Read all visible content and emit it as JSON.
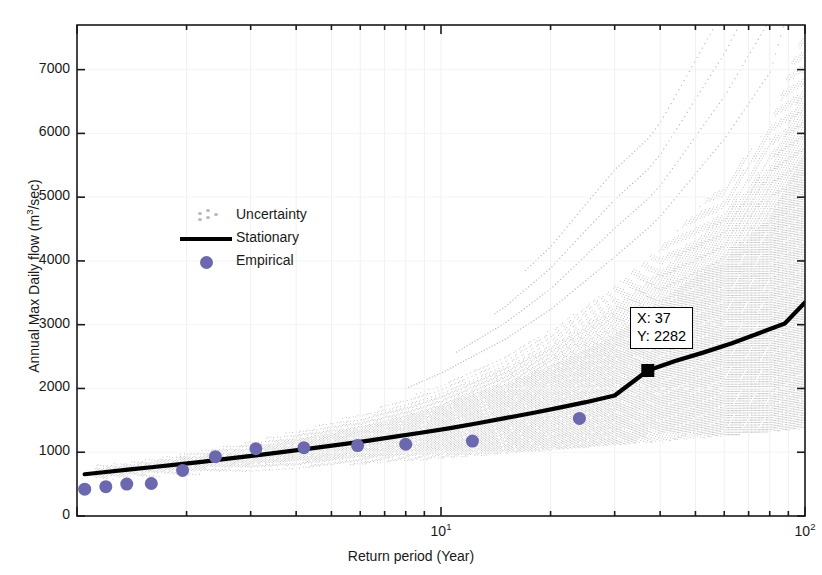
{
  "figure": {
    "title": "Adezai River at Adezai Bridge",
    "background": "#ffffff"
  },
  "datatip": {
    "x_label": "X: 37",
    "y_label": "Y: 2282",
    "marker_color": "#000000"
  },
  "legend": {
    "entries": [
      {
        "label": "Uncertainty",
        "style": "dotted",
        "color": "#b9b9b9"
      },
      {
        "label": "Stationary",
        "style": "line",
        "color": "#000000"
      },
      {
        "label": "Empirical",
        "style": "marker",
        "color": "#6b68b0"
      }
    ]
  },
  "chart_data": {
    "type": "line",
    "title": "Adezai River at Adezai Bridge",
    "xlabel": "Return period (Year)",
    "ylabel": "Annual Max  Daily flow (m3/sec)",
    "ylabel_display": "Annual Max  Daily flow (m&sup3;/sec)",
    "xscale": "log",
    "yscale": "linear",
    "xlim": [
      1,
      100
    ],
    "ylim": [
      0,
      7700
    ],
    "xticks": [
      10,
      100
    ],
    "xtick_labels": [
      "10^1",
      "10^2"
    ],
    "yticks": [
      0,
      1000,
      2000,
      3000,
      4000,
      5000,
      6000,
      7000
    ],
    "ytick_labels": [
      "0",
      "1000",
      "2000",
      "3000",
      "4000",
      "5000",
      "6000",
      "7000"
    ],
    "grid": false,
    "legend_position": "center-left",
    "series": [
      {
        "name": "Stationary",
        "type": "line",
        "color": "#000000",
        "linewidth": 4,
        "x": [
          1.05,
          1.2,
          1.4,
          1.6,
          1.9,
          2.2,
          2.6,
          3.1,
          3.7,
          4.4,
          5.2,
          6.2,
          7.4,
          8.8,
          10.5,
          12.5,
          15,
          18,
          21,
          25,
          30,
          37,
          44,
          53,
          63,
          75,
          88,
          100
        ],
        "y": [
          655,
          690,
          730,
          765,
          810,
          850,
          900,
          950,
          1005,
          1060,
          1115,
          1175,
          1240,
          1305,
          1375,
          1450,
          1535,
          1620,
          1695,
          1785,
          1890,
          2282,
          2430,
          2570,
          2710,
          2870,
          3020,
          3350
        ]
      },
      {
        "name": "Empirical",
        "type": "scatter",
        "color": "#6b68b0",
        "marker": "circle",
        "markersize": 13,
        "x": [
          1.05,
          1.2,
          1.37,
          1.6,
          1.95,
          2.4,
          3.1,
          4.2,
          5.9,
          8.0,
          12.2,
          24.0
        ],
        "y": [
          420,
          460,
          500,
          510,
          715,
          930,
          1055,
          1070,
          1105,
          1125,
          1175,
          1530
        ]
      },
      {
        "name": "Uncertainty",
        "type": "band",
        "color": "#c4c4c4",
        "description": "Dotted Monte-Carlo ensemble envelope fanning out with return period",
        "x": [
          1.05,
          1.5,
          2,
          3,
          4,
          6,
          8,
          10,
          15,
          20,
          30,
          40,
          60,
          80,
          100
        ],
        "upper": [
          780,
          880,
          990,
          1180,
          1340,
          1610,
          1850,
          2060,
          2520,
          2920,
          3620,
          4220,
          5250,
          6130,
          7700
        ],
        "lower": [
          560,
          600,
          640,
          700,
          745,
          810,
          860,
          900,
          975,
          1030,
          1110,
          1170,
          1255,
          1320,
          1370
        ]
      }
    ],
    "annotations": [
      {
        "type": "datatip",
        "x": 37,
        "y": 2282,
        "text_x": "X: 37",
        "text_y": "Y: 2282"
      }
    ]
  }
}
